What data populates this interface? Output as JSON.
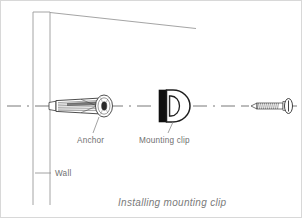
{
  "figure": {
    "caption": "Installing mounting clip",
    "background_color": "#ffffff",
    "line_color": "#444444",
    "wall_line_color": "#9a9a9a",
    "centerline_color": "#555555",
    "label_color": "#6f6f6f",
    "caption_color": "#7a7a7a"
  },
  "labels": {
    "wall": "Wall",
    "anchor": "Anchor",
    "mounting_clip": "Mounting clip"
  },
  "parts": [
    {
      "id": "wall",
      "name": "Wall",
      "description": "Vertical wall section shown in perspective with sloping top edge"
    },
    {
      "id": "anchor",
      "name": "Anchor",
      "description": "Tapered hatched wall anchor sleeve with round flanged head seated in the wall"
    },
    {
      "id": "mounting-clip",
      "name": "Mounting clip",
      "description": "D-shaped mounting clip with solid black back plate and central slot"
    },
    {
      "id": "screw",
      "name": "Screw",
      "description": "Threaded screw with pointed tip at left and round pan head at right"
    }
  ],
  "assembly": {
    "centerline_style": "dash-dot",
    "order": [
      "wall",
      "anchor",
      "mounting-clip",
      "screw"
    ],
    "direction": "left-to-right"
  }
}
